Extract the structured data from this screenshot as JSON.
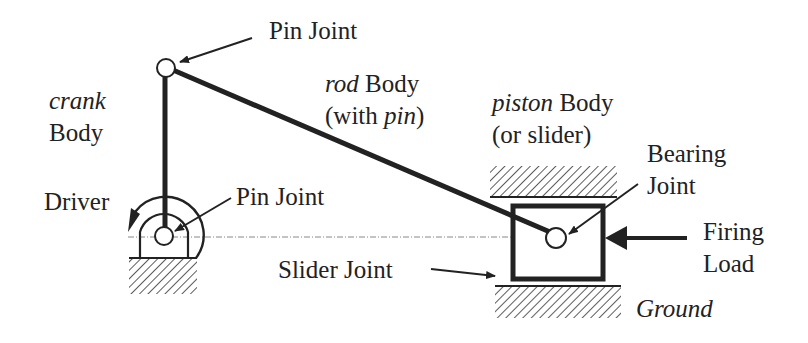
{
  "labels": {
    "top_pin": "Pin Joint",
    "crank_line1": "crank",
    "crank_line2": "Body",
    "rod_line1_italic": "rod",
    "rod_line1_rest": " Body",
    "rod_line2_open": "(with ",
    "rod_line2_italic": "pin",
    "rod_line2_close": ")",
    "piston_line1_italic": "piston",
    "piston_line1_rest": " Body",
    "piston_line2": "(or slider)",
    "bearing_line1": "Bearing",
    "bearing_line2": "Joint",
    "driver": "Driver",
    "bottom_pin": "Pin Joint",
    "firing_line1": "Firing",
    "firing_line2": "Load",
    "slider_joint": "Slider Joint",
    "ground": "Ground"
  },
  "colors": {
    "ink": "#222222",
    "centerline": "#888888",
    "background": "#ffffff"
  }
}
